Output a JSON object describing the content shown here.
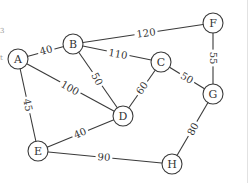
{
  "graph": {
    "nodes": [
      {
        "id": "A",
        "label": "A",
        "x": 18,
        "y": 59
      },
      {
        "id": "B",
        "label": "B",
        "x": 73,
        "y": 44
      },
      {
        "id": "C",
        "label": "C",
        "x": 161,
        "y": 62
      },
      {
        "id": "D",
        "label": "D",
        "x": 123,
        "y": 116
      },
      {
        "id": "E",
        "label": "E",
        "x": 38,
        "y": 151
      },
      {
        "id": "F",
        "label": "F",
        "x": 213,
        "y": 23
      },
      {
        "id": "G",
        "label": "G",
        "x": 213,
        "y": 94
      },
      {
        "id": "H",
        "label": "H",
        "x": 172,
        "y": 164
      }
    ],
    "edges": [
      {
        "from": "A",
        "to": "B",
        "weight": "40",
        "lx": 46,
        "ly": 50,
        "rot": -15
      },
      {
        "from": "B",
        "to": "F",
        "weight": "120",
        "lx": 146,
        "ly": 33,
        "rot": -8
      },
      {
        "from": "B",
        "to": "C",
        "weight": "110",
        "lx": 118,
        "ly": 54,
        "rot": 10
      },
      {
        "from": "B",
        "to": "D",
        "weight": "50",
        "lx": 97,
        "ly": 79,
        "rot": 62
      },
      {
        "from": "A",
        "to": "D",
        "weight": "100",
        "lx": 70,
        "ly": 88,
        "rot": 30
      },
      {
        "from": "C",
        "to": "D",
        "weight": "60",
        "lx": 142,
        "ly": 88,
        "rot": -55
      },
      {
        "from": "C",
        "to": "G",
        "weight": "50",
        "lx": 187,
        "ly": 78,
        "rot": 30
      },
      {
        "from": "F",
        "to": "G",
        "weight": "55",
        "lx": 213,
        "ly": 58,
        "rot": 90
      },
      {
        "from": "A",
        "to": "E",
        "weight": "45",
        "lx": 28,
        "ly": 105,
        "rot": 78
      },
      {
        "from": "E",
        "to": "D",
        "weight": "40",
        "lx": 80,
        "ly": 133,
        "rot": -22
      },
      {
        "from": "E",
        "to": "H",
        "weight": "90",
        "lx": 104,
        "ly": 157,
        "rot": 5
      },
      {
        "from": "G",
        "to": "H",
        "weight": "80",
        "lx": 193,
        "ly": 129,
        "rot": -62
      }
    ]
  },
  "node_radius": 10,
  "colors": {
    "stroke": "#3a3a3a",
    "text": "#333333",
    "background": "#ffffff",
    "border": "#dddddd"
  }
}
